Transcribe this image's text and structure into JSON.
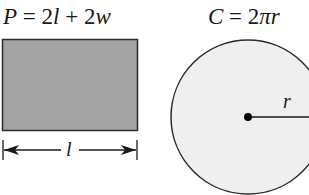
{
  "rectangle": {
    "formula": {
      "lhs": "P",
      "eq": " = 2",
      "v1": "l",
      "plus": " + 2",
      "v2": "w"
    },
    "dimension_label": "l",
    "fill_color": "#a3a3a3",
    "stroke_color": "#2a2a2a"
  },
  "circle": {
    "formula": {
      "lhs": "C",
      "eq": " = 2",
      "pi": "π",
      "v": "r"
    },
    "radius_label": "r",
    "fill_color": "#efefef",
    "stroke_color": "#2a2a2a"
  }
}
